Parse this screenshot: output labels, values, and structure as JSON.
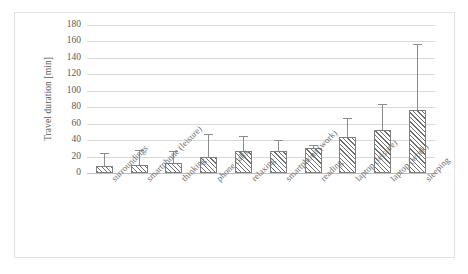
{
  "chart_data": {
    "type": "bar",
    "title": "",
    "xlabel": "",
    "ylabel": "Travel duration [min]",
    "ylim": [
      0,
      180
    ],
    "ytick_step": 20,
    "yticks": [
      180,
      160,
      140,
      120,
      100,
      80,
      60,
      40,
      20,
      0
    ],
    "grid": "horizontal",
    "legend": "none",
    "error_bars": "upper-only",
    "bar_style": "diagonal-hatch",
    "categories": [
      "surroundings",
      "smartphone (leisure)",
      "thinking",
      "phone calls",
      "relaxing",
      "smartphone (work)",
      "reading",
      "laptop (leisure)",
      "laptop (work)",
      "sleeping"
    ],
    "values": [
      8,
      10,
      12,
      19,
      27,
      27,
      30,
      44,
      52,
      77
    ],
    "error_upper": [
      23,
      27,
      26,
      46,
      44,
      39,
      33,
      66,
      83,
      156
    ],
    "series": [
      {
        "name": "Travel duration",
        "values": [
          8,
          10,
          12,
          19,
          27,
          27,
          30,
          44,
          52,
          77
        ],
        "error_upper": [
          23,
          27,
          26,
          46,
          44,
          39,
          33,
          66,
          83,
          156
        ]
      }
    ],
    "colors": {
      "bar_fill": "#ffffff",
      "bar_hatch": "#6f6f6f",
      "bar_border": "#7f7f7f",
      "error_bar": "#8c8c8c",
      "gridline": "#d9d9d9",
      "axis_text": "#595959",
      "frame_border": "#e2e2e2"
    }
  }
}
